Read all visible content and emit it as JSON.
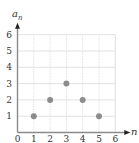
{
  "chart_data": {
    "type": "scatter",
    "title": "",
    "xlabel": "n",
    "ylabel": "a_n",
    "x_ticks": [
      "0",
      "1",
      "2",
      "3",
      "4",
      "5",
      "6"
    ],
    "y_ticks": [
      "1",
      "2",
      "3",
      "4",
      "5",
      "6"
    ],
    "xlim": [
      0,
      6
    ],
    "ylim": [
      0,
      6
    ],
    "grid": true,
    "legend": null,
    "series": [
      {
        "name": "a_n",
        "x": [
          1,
          2,
          3,
          4,
          5
        ],
        "y": [
          1,
          2,
          3,
          2,
          1
        ]
      }
    ],
    "colors": {
      "axis": "#8a8a8a",
      "grid": "#d9d9d9",
      "point": "#8c8c8c",
      "text": "#333333"
    }
  },
  "labels": {
    "y_axis": "a",
    "y_axis_sub": "n",
    "x_axis": "n"
  }
}
